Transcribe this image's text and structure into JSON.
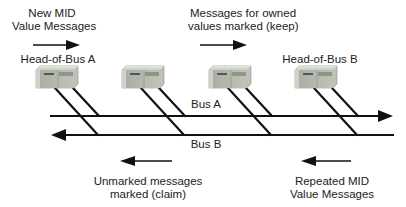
{
  "diagram": {
    "top_left_caption": {
      "line1": "New MID",
      "line2": "Value Messages",
      "arrow_direction": "right"
    },
    "top_mid_caption": {
      "line1": "Messages for owned",
      "line2": "values marked (keep)",
      "arrow_direction": "right"
    },
    "bottom_left_caption": {
      "line1": "Unmarked messages",
      "line2": "marked (claim)",
      "arrow_direction": "left"
    },
    "bottom_right_caption": {
      "line1": "Repeated MID",
      "line2": "Value Messages",
      "arrow_direction": "left"
    },
    "devices": [
      {
        "id": "device-1",
        "label": "Head-of-Bus A"
      },
      {
        "id": "device-2",
        "label": ""
      },
      {
        "id": "device-3",
        "label": ""
      },
      {
        "id": "device-4",
        "label": "Head-of-Bus B"
      }
    ],
    "buses": [
      {
        "id": "bus-a",
        "label": "Bus A",
        "direction": "right"
      },
      {
        "id": "bus-b",
        "label": "Bus B",
        "direction": "left"
      }
    ],
    "colors": {
      "line": "#111111",
      "device_body": "#b9bdb4",
      "device_face": "#9fa69a",
      "device_top": "#d6d9d2"
    }
  }
}
